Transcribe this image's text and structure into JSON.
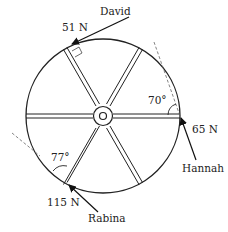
{
  "diagram": {
    "type": "force-diagram",
    "spokes": 6,
    "forces": [
      {
        "person": "David",
        "magnitude": "51 N",
        "angle_note": "perpendicular to spoke"
      },
      {
        "person": "Hannah",
        "magnitude": "65 N",
        "angle": "70°"
      },
      {
        "person": "Rabina",
        "magnitude": "115 N",
        "angle": "77°"
      }
    ]
  },
  "labels": {
    "david": "David",
    "david_force": "51 N",
    "hannah": "Hannah",
    "hannah_force": "65 N",
    "hannah_angle": "70°",
    "rabina": "Rabina",
    "rabina_force": "115 N",
    "rabina_angle": "77°"
  },
  "colors": {
    "stroke": "#222222",
    "dashed": "#666666",
    "background": "#ffffff"
  }
}
